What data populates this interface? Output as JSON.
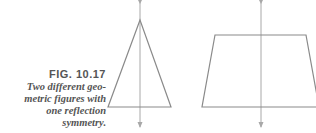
{
  "caption": {
    "label": "FIG. 10.17",
    "lines": [
      "Two different geo-",
      "metric figures with",
      "one reflection",
      "symmetry."
    ]
  },
  "figures": [
    {
      "name": "isosceles-triangle",
      "axis": "vertical reflection axis"
    },
    {
      "name": "isosceles-trapezoid",
      "axis": "vertical reflection axis"
    }
  ],
  "colors": {
    "stroke": "#8a8a8a",
    "axis": "#a0a0a0",
    "text": "#555555"
  }
}
